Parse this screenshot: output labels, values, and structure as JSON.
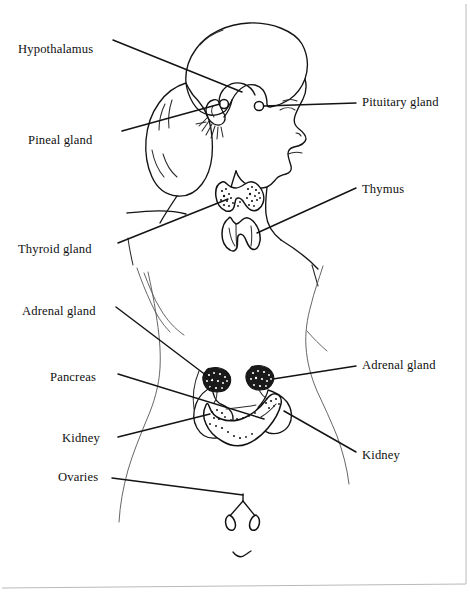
{
  "figure": {
    "view": "lateral head and profile with abdominal torso",
    "background_color": "#ffffff",
    "ink_color": "#111111",
    "border_color": "#b9b9b9"
  },
  "labels": {
    "hypothalamus": "Hypothalamus",
    "pituitary_gland": "Pituitary gland",
    "pineal_gland": "Pineal gland",
    "thymus": "Thymus",
    "thyroid_gland": "Thyroid gland",
    "adrenal_gland_left": "Adrenal gland",
    "adrenal_gland_right": "Adrenal gland",
    "pancreas": "Pancreas",
    "kidney_left": "Kidney",
    "kidney_right": "Kidney",
    "ovaries": "Ovaries"
  },
  "label_positions": {
    "hypothalamus": {
      "x": 18,
      "y": 43,
      "side": "left"
    },
    "pituitary_gland": {
      "x": 362,
      "y": 96,
      "side": "right"
    },
    "pineal_gland": {
      "x": 28,
      "y": 134,
      "side": "left"
    },
    "thymus": {
      "x": 362,
      "y": 183,
      "side": "right"
    },
    "thyroid_gland": {
      "x": 18,
      "y": 243,
      "side": "left"
    },
    "adrenal_gland_left": {
      "x": 22,
      "y": 305,
      "side": "left"
    },
    "adrenal_gland_right": {
      "x": 362,
      "y": 359,
      "side": "right"
    },
    "pancreas": {
      "x": 50,
      "y": 371,
      "side": "left"
    },
    "kidney_left": {
      "x": 62,
      "y": 432,
      "side": "left"
    },
    "kidney_right": {
      "x": 362,
      "y": 449,
      "side": "right"
    },
    "ovaries": {
      "x": 58,
      "y": 471,
      "side": "left"
    }
  },
  "organs": [
    {
      "name": "hypothalamus",
      "x": 228,
      "y": 86,
      "note": "brain base, lobed mass above brainstem"
    },
    {
      "name": "pituitary-gland",
      "x": 258,
      "y": 106,
      "note": "small round knob anterior to pineal"
    },
    {
      "name": "pineal-gland",
      "x": 225,
      "y": 104,
      "note": "small knob at back of midbrain"
    },
    {
      "name": "thyroid-gland",
      "x": 234,
      "y": 196,
      "note": "butterfly shaped stippled gland at neck base"
    },
    {
      "name": "thymus",
      "x": 234,
      "y": 232,
      "note": "bilobed gland below thyroid"
    },
    {
      "name": "adrenal-gland-left",
      "x": 216,
      "y": 382,
      "note": "stippled cap above left kidney"
    },
    {
      "name": "adrenal-gland-right",
      "x": 259,
      "y": 380,
      "note": "stippled cap above right kidney"
    },
    {
      "name": "kidney-left",
      "x": 216,
      "y": 416,
      "note": "bean shaped organ, viewer left"
    },
    {
      "name": "kidney-right",
      "x": 281,
      "y": 414,
      "note": "bean shaped organ, viewer right"
    },
    {
      "name": "pancreas",
      "x": 247,
      "y": 417,
      "note": "elongated gland spanning between kidneys"
    },
    {
      "name": "ovaries",
      "x": 243,
      "y": 516,
      "note": "paired almond organs on uterine tubes"
    }
  ],
  "leader_lines": [
    {
      "organ": "hypothalamus",
      "from": [
        113,
        40
      ],
      "to": [
        242,
        92
      ]
    },
    {
      "organ": "pituitary-gland",
      "from": [
        356,
        103
      ],
      "to": [
        262,
        107
      ]
    },
    {
      "organ": "pineal-gland",
      "from": [
        122,
        131
      ],
      "to": [
        222,
        105
      ]
    },
    {
      "organ": "thymus",
      "from": [
        356,
        188
      ],
      "to": [
        258,
        233
      ]
    },
    {
      "organ": "thyroid-gland",
      "from": [
        118,
        243
      ],
      "to": [
        229,
        199
      ]
    },
    {
      "organ": "adrenal-gland-left",
      "from": [
        116,
        307
      ],
      "to": [
        213,
        380
      ]
    },
    {
      "organ": "adrenal-gland-right",
      "from": [
        356,
        366
      ],
      "to": [
        272,
        380
      ]
    },
    {
      "organ": "pancreas",
      "from": [
        118,
        374
      ],
      "to": [
        262,
        418
      ]
    },
    {
      "organ": "kidney-left",
      "from": [
        118,
        437
      ],
      "to": [
        212,
        416
      ]
    },
    {
      "organ": "kidney-right",
      "from": [
        356,
        452
      ],
      "to": [
        283,
        412
      ]
    },
    {
      "organ": "ovaries",
      "from": [
        112,
        478
      ],
      "to": [
        242,
        495
      ]
    }
  ]
}
